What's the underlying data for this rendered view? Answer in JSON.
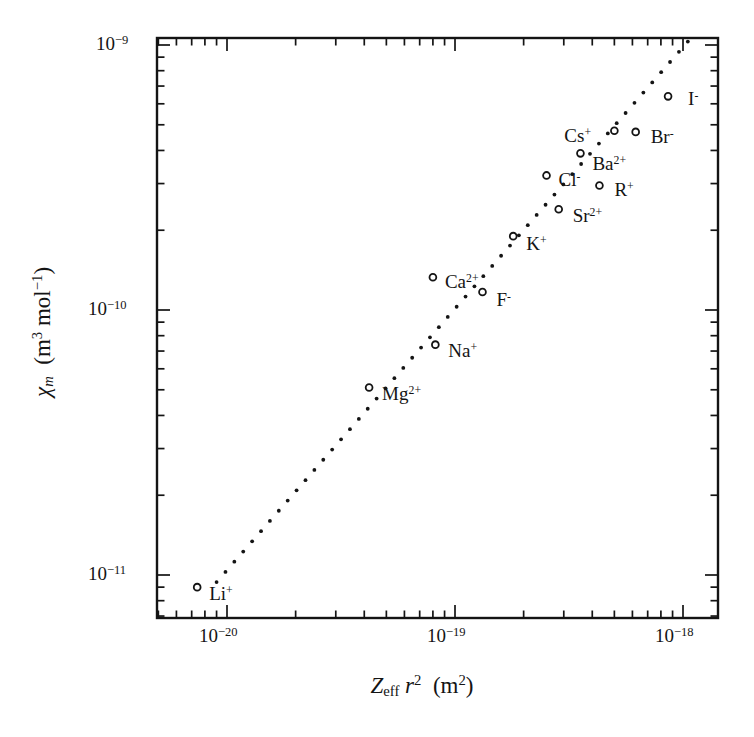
{
  "chart_data": {
    "type": "scatter",
    "title": "",
    "subtitle": "",
    "xlabel": "Z_eff r^2  (m^2)",
    "ylabel": "chi_m  (m^3 mol^-1)",
    "xscale": "log",
    "yscale": "log",
    "xlim": [
      7e-21,
      1.2e-18
    ],
    "ylim": [
      7e-12,
      1.12e-09
    ],
    "grid": false,
    "legend": false,
    "xticks": [
      1e-20,
      1e-19,
      1e-18
    ],
    "xtick_labels": [
      "10-20",
      "10-19",
      "10-18"
    ],
    "yticks": [
      1e-09,
      1e-10,
      1e-11
    ],
    "ytick_labels": [
      "10-9",
      "10-10",
      "10-11"
    ],
    "series": [
      {
        "name": "ions",
        "marker": "open-circle",
        "points": [
          {
            "label": "Li",
            "charge": "+",
            "x": 7.4e-21,
            "y": 9e-12
          },
          {
            "label": "Mg",
            "charge": "2+",
            "x": 4.2e-20,
            "y": 5.1e-11
          },
          {
            "label": "Na",
            "charge": "+",
            "x": 8.2e-20,
            "y": 7.4e-11
          },
          {
            "label": "Ca",
            "charge": "2+",
            "x": 8e-20,
            "y": 1.33e-10
          },
          {
            "label": "F",
            "charge": "-",
            "x": 1.32e-19,
            "y": 1.17e-10
          },
          {
            "label": "K",
            "charge": "+",
            "x": 1.8e-19,
            "y": 1.9e-10
          },
          {
            "label": "Cl",
            "charge": "-",
            "x": 2.52e-19,
            "y": 3.22e-10
          },
          {
            "label": "Sr",
            "charge": "2+",
            "x": 2.85e-19,
            "y": 2.4e-10
          },
          {
            "label": "R",
            "charge": "+",
            "x": 4.3e-19,
            "y": 2.95e-10
          },
          {
            "label": "Ba",
            "charge": "2+",
            "x": 3.55e-19,
            "y": 3.9e-10
          },
          {
            "label": "Cs",
            "charge": "+",
            "x": 5e-19,
            "y": 4.75e-10
          },
          {
            "label": "Br",
            "charge": "-",
            "x": 6.2e-19,
            "y": 4.7e-10
          },
          {
            "label": "I",
            "charge": "-",
            "x": 8.6e-19,
            "y": 6.4e-10
          }
        ]
      }
    ],
    "trendline": {
      "style": "dotted",
      "x_start": 9e-21,
      "y_start": 9.4e-12,
      "x_end": 1.05e-18,
      "y_end": 1.03e-09
    }
  },
  "axes": {
    "y": {
      "label_symbol": "χ",
      "label_sub": "m",
      "label_unit_open": "(m",
      "label_unit_sup1": "3",
      "label_unit_mid": "mol",
      "label_unit_sup2": "−1",
      "label_unit_close": ")"
    },
    "x": {
      "label_symbol": "Z",
      "label_sub": "eff",
      "label_r": "r",
      "label_r_sup": "2",
      "label_unit_open": "(m",
      "label_unit_sup": "2",
      "label_unit_close": ")"
    }
  },
  "ticks": {
    "y": [
      {
        "mantissa": "10",
        "exponent": "−9"
      },
      {
        "mantissa": "10",
        "exponent": "−10"
      },
      {
        "mantissa": "10",
        "exponent": "−11"
      }
    ],
    "x": [
      {
        "mantissa": "10",
        "exponent": "−20"
      },
      {
        "mantissa": "10",
        "exponent": "−19"
      },
      {
        "mantissa": "10",
        "exponent": "−18"
      }
    ]
  },
  "point_labels": [
    {
      "base": "Li",
      "sup": "+"
    },
    {
      "base": "Mg",
      "sup": "2+"
    },
    {
      "base": "Na",
      "sup": "+"
    },
    {
      "base": "Ca",
      "sup": "2+"
    },
    {
      "base": "F",
      "sup": "-"
    },
    {
      "base": "K",
      "sup": "+"
    },
    {
      "base": "Cl",
      "sup": "-"
    },
    {
      "base": "Sr",
      "sup": "2+"
    },
    {
      "base": "R",
      "sup": "+"
    },
    {
      "base": "Ba",
      "sup": "2+"
    },
    {
      "base": "Cs",
      "sup": "+"
    },
    {
      "base": "Br",
      "sup": "-"
    },
    {
      "base": "I",
      "sup": "-"
    }
  ],
  "style": {
    "frame_color": "#141414",
    "marker_color": "#141414",
    "dot_color": "#141414",
    "background": "#ffffff"
  }
}
